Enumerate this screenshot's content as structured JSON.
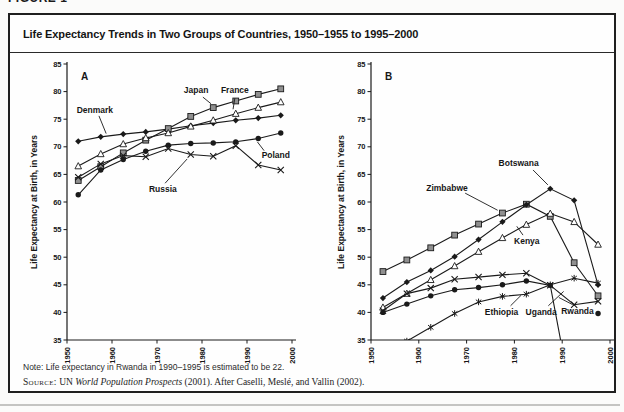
{
  "figure": {
    "page_header": "FIGURE 1",
    "title": "Life Expectancy Trends in Two Groups of Countries, 1950–1955 to 1995–2000",
    "note": "Note: Life expectancy in Rwanda in 1990–1995 is estimated to be 22.",
    "source_label": "Source:",
    "source_un": " UN ",
    "source_italic": "World Population Prospects",
    "source_rest": " (2001). After Caselli, Meslé, and Vallin (2002).",
    "colors": {
      "ink": "#1a1a1a",
      "square_fill": "#8f8f8f",
      "open_fill": "#ffffff",
      "background": "#fefefe"
    }
  },
  "chart_data": [
    {
      "type": "line",
      "panel": "A",
      "ylabel": "Life Expectancy at Birth, in Years",
      "ylim": [
        35,
        85
      ],
      "yticks": [
        35,
        40,
        45,
        50,
        55,
        60,
        65,
        70,
        75,
        80,
        85
      ],
      "xlim": [
        1950,
        2000
      ],
      "xticks": [
        1950,
        1960,
        1970,
        1980,
        1990,
        2000
      ],
      "grid": false,
      "x": [
        1952.5,
        1957.5,
        1962.5,
        1967.5,
        1972.5,
        1977.5,
        1982.5,
        1987.5,
        1992.5,
        1997.5
      ],
      "series": [
        {
          "name": "Denmark",
          "marker": "diamond-filled",
          "values": [
            71.0,
            71.8,
            72.3,
            72.7,
            73.2,
            73.8,
            74.3,
            74.8,
            75.2,
            75.7
          ],
          "label": {
            "x": 1956.2,
            "y": 76.7
          },
          "callout": [
            1957.1,
            75.6,
            1958.7,
            72.4
          ]
        },
        {
          "name": "Japan",
          "marker": "square-filled",
          "values": [
            63.9,
            66.4,
            68.9,
            71.2,
            73.3,
            75.5,
            77.1,
            78.3,
            79.5,
            80.5
          ],
          "label": {
            "x": 1978.7,
            "y": 80.2
          },
          "callout": [
            1980.2,
            79.0,
            1982.0,
            77.8
          ]
        },
        {
          "name": "France",
          "marker": "triangle-open",
          "values": [
            66.5,
            68.7,
            70.5,
            71.6,
            72.5,
            73.7,
            74.8,
            76.0,
            77.1,
            78.1
          ],
          "label": {
            "x": 1987.3,
            "y": 80.2
          },
          "callout": [
            1987.3,
            78.8,
            1986.9,
            76.8
          ]
        },
        {
          "name": "Poland",
          "marker": "circle-filled",
          "values": [
            61.3,
            65.8,
            67.7,
            69.2,
            70.3,
            70.6,
            70.7,
            70.9,
            71.5,
            72.5
          ],
          "label": {
            "x": 1996.4,
            "y": 68.6
          },
          "callout": [
            1993.8,
            69.3,
            1992.3,
            70.9
          ]
        },
        {
          "name": "Russia",
          "marker": "x-cross",
          "values": [
            64.5,
            66.9,
            68.4,
            68.2,
            69.7,
            68.6,
            68.3,
            70.2,
            66.7,
            65.8
          ],
          "label": {
            "x": 1971.3,
            "y": 62.4
          },
          "callout": [
            1971.8,
            63.4,
            1976.7,
            67.8
          ]
        }
      ]
    },
    {
      "type": "line",
      "panel": "B",
      "ylabel": "Life Expectancy at Birth, in Years",
      "ylim": [
        35,
        85
      ],
      "yticks": [
        35,
        40,
        45,
        50,
        55,
        60,
        65,
        70,
        75,
        80,
        85
      ],
      "xlim": [
        1950,
        2000
      ],
      "xticks": [
        1950,
        1960,
        1970,
        1980,
        1990,
        2000
      ],
      "grid": false,
      "x": [
        1952.5,
        1957.5,
        1962.5,
        1967.5,
        1972.5,
        1977.5,
        1982.5,
        1987.5,
        1992.5,
        1997.5
      ],
      "series": [
        {
          "name": "Zimbabwe",
          "marker": "square-filled",
          "values": [
            47.4,
            49.5,
            51.7,
            54.0,
            56.0,
            58.0,
            59.6,
            57.4,
            49.0,
            43.0
          ],
          "label": {
            "x": 1965.9,
            "y": 62.5
          },
          "callout": [
            1969.7,
            61.6,
            1976.5,
            58.5
          ]
        },
        {
          "name": "Botswana",
          "marker": "diamond-filled",
          "values": [
            42.6,
            45.5,
            47.6,
            50.1,
            53.2,
            56.4,
            59.5,
            62.4,
            60.3,
            45.0
          ],
          "label": {
            "x": 1980.9,
            "y": 67.1
          },
          "callout": [
            1983.9,
            65.8,
            1987.0,
            63.1
          ]
        },
        {
          "name": "Kenya",
          "marker": "triangle-open",
          "values": [
            40.9,
            43.4,
            45.9,
            48.4,
            51.0,
            53.5,
            55.9,
            57.9,
            56.4,
            52.3
          ],
          "label": {
            "x": 1982.6,
            "y": 52.9
          },
          "callout": [
            1981.8,
            54.0,
            1980.5,
            55.6
          ]
        },
        {
          "name": "Uganda",
          "marker": "x-cross",
          "values": [
            40.3,
            43.4,
            44.4,
            46.0,
            46.4,
            46.8,
            47.1,
            44.9,
            41.4,
            42.0
          ],
          "label": {
            "x": 1985.6,
            "y": 40.1
          },
          "callout": [
            1987.1,
            41.2,
            1990.3,
            43.8
          ]
        },
        {
          "name": "Ethiopia",
          "marker": "asterisk",
          "values": [
            33.0,
            34.8,
            37.3,
            39.8,
            41.9,
            42.9,
            43.3,
            45.0,
            46.2,
            45.3
          ],
          "label": {
            "x": 1977.3,
            "y": 40.1
          },
          "callout": [
            1979.2,
            41.2,
            1981.4,
            43.1
          ]
        },
        {
          "name": "Rwanda",
          "marker": "circle-filled",
          "values": [
            40.0,
            41.5,
            43.0,
            44.1,
            44.5,
            45.0,
            45.7,
            44.9,
            22.0,
            null
          ],
          "extra_points": [
            [
              1997.5,
              39.8
            ]
          ],
          "label": {
            "x": 1993.2,
            "y": 40.3
          },
          "callout": [
            1992.2,
            41.4,
            1989.3,
            42.7
          ]
        }
      ]
    }
  ]
}
